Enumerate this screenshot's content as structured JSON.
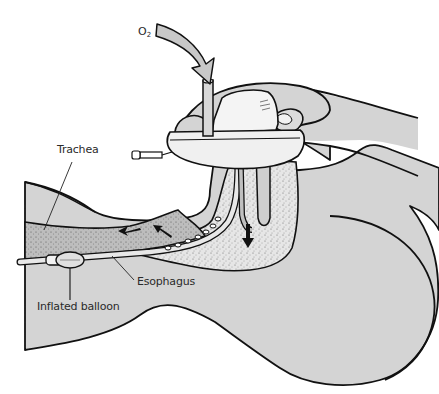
{
  "figure": {
    "colors": {
      "tissue_fill": "#d4d4d4",
      "airway_fill": "#c4c4c4",
      "outline": "#111111",
      "background": "#ffffff",
      "mask_fill": "#ececec",
      "arrow_fill": "#c8c8c8"
    }
  },
  "labels": {
    "oxygen": {
      "main": "O",
      "sub": "2"
    },
    "trachea": "Trachea",
    "esophagus": "Esophagus",
    "balloon": "Inflated balloon"
  }
}
